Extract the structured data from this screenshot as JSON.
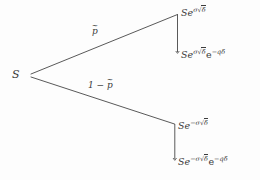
{
  "diagram": {
    "type": "binomial-tree",
    "background_color": "#fdfdfd",
    "line_color": "#3b3b3b",
    "text_color": "#3b3b3b",
    "root": {
      "label": "S",
      "name": "spot-price"
    },
    "branches": [
      {
        "name": "up-branch",
        "probability_label": "p̃",
        "probability_parts": {
          "base": "p",
          "accent": "~"
        },
        "terminal": {
          "label": "Se^{σ√δ}",
          "parts": {
            "base": "Se",
            "exponent": "σ√δ"
          }
        },
        "adjusted_terminal": {
          "label": "Se^{σ√δ}e^{-qδ}",
          "parts": {
            "base": "Se",
            "exponent": "σ√δ",
            "factor_base": "e",
            "factor_exponent": "-qδ"
          }
        }
      },
      {
        "name": "down-branch",
        "probability_label": "1 − p̃",
        "probability_parts": {
          "prefix": "1 − ",
          "base": "p",
          "accent": "~"
        },
        "terminal": {
          "label": "Se^{-σ√δ}",
          "parts": {
            "base": "Se",
            "exponent": "-σ√δ"
          }
        },
        "adjusted_terminal": {
          "label": "Se^{-σ√δ}e^{-qδ}",
          "parts": {
            "base": "Se",
            "exponent": "-σ√δ",
            "factor_base": "e",
            "factor_exponent": "-qδ"
          }
        }
      }
    ],
    "symbols": {
      "sigma": "σ",
      "delta": "δ",
      "q": "q",
      "radical": "√",
      "minus": "−",
      "tilde": "~"
    },
    "glyphs": {
      "S": "S",
      "Se": "Se",
      "e": "e",
      "one_minus": "1 − ",
      "p": "p",
      "sigma_sqrt_delta": "σ",
      "neg_sigma": "−σ",
      "delta_radicand": "δ",
      "neg_q_delta": "−qδ"
    }
  }
}
